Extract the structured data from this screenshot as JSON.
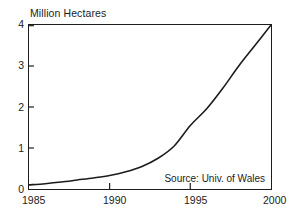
{
  "chart_data": {
    "type": "line",
    "title": "",
    "ylabel": "Million Hectares",
    "xlabel": "",
    "xlim": [
      1985,
      2000
    ],
    "ylim": [
      0,
      4
    ],
    "grid": false,
    "legend": null,
    "annotations": [
      {
        "text": "Source: Univ. of Wales",
        "position": "inside-bottom-right"
      }
    ],
    "y_ticks": [
      "0",
      "1",
      "2",
      "3",
      "4"
    ],
    "y_tick_values": [
      0,
      1,
      2,
      3,
      4
    ],
    "x_ticks": [
      "1985",
      "1990",
      "1995",
      "2000"
    ],
    "x_tick_values": [
      1985,
      1990,
      1995,
      2000
    ],
    "series": [
      {
        "name": "Area",
        "x": [
          1985,
          1986,
          1987,
          1988,
          1989,
          1990,
          1991,
          1992,
          1993,
          1994,
          1995,
          1996,
          1997,
          1998,
          1999,
          2000
        ],
        "values": [
          0.1,
          0.13,
          0.17,
          0.22,
          0.27,
          0.33,
          0.42,
          0.55,
          0.75,
          1.05,
          1.55,
          1.95,
          2.45,
          3.0,
          3.5,
          4.0
        ]
      }
    ]
  },
  "axis": {
    "y_title": "Million Hectares",
    "y_labels": [
      "4",
      "3",
      "2",
      "1",
      "0"
    ],
    "x_labels": [
      "1985",
      "1990",
      "1995",
      "2000"
    ]
  },
  "annotation": {
    "source": "Source: Univ. of Wales"
  },
  "colors": {
    "line": "#1c1c1c",
    "axis": "#1c1c1c",
    "background": "#ffffff"
  }
}
